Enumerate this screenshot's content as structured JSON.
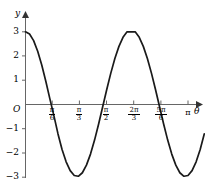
{
  "figure": {
    "background": "#ffffff",
    "curve_color": "#1a1a1a",
    "axis_color": "#555555"
  },
  "axes": {
    "x_axis_name": "θ",
    "y_axis_name": "y",
    "origin_label": "O"
  },
  "chart_data": {
    "type": "line",
    "title": "",
    "xlabel": "θ",
    "ylabel": "y",
    "grid": false,
    "legend": null,
    "function": "y = 3 cos(2θ)",
    "amplitude": 3,
    "period": "π",
    "xlim": [
      0,
      3.4557519
    ],
    "ylim": [
      -3.6,
      3.6
    ],
    "x_ticks": [
      {
        "value": 0.5235988,
        "label_num": "π",
        "label_den": "6"
      },
      {
        "value": 1.0471976,
        "label_num": "π",
        "label_den": "3"
      },
      {
        "value": 1.5707963,
        "label_num": "π",
        "label_den": "2"
      },
      {
        "value": 2.0943951,
        "label_num": "2π",
        "label_den": "3"
      },
      {
        "value": 2.6179939,
        "label_num": "5π",
        "label_den": "6"
      },
      {
        "value": 3.1415927,
        "label_num": "π",
        "label_den": ""
      }
    ],
    "y_ticks": [
      {
        "value": 3,
        "label": "3"
      },
      {
        "value": 2,
        "label": "2"
      },
      {
        "value": 1,
        "label": "1"
      },
      {
        "value": -1,
        "label": "−1"
      },
      {
        "value": -2,
        "label": "−2"
      },
      {
        "value": -3,
        "label": "−3"
      }
    ],
    "key_points": [
      {
        "x": 0,
        "y": 3,
        "note": "maximum at theta = 0"
      },
      {
        "x": 0.7853982,
        "y": 0,
        "note": "zero at pi/4"
      },
      {
        "x": 1.5707963,
        "y": -3,
        "note": "minimum at pi/2"
      },
      {
        "x": 2.3561945,
        "y": 0,
        "note": "zero at 3pi/4"
      },
      {
        "x": 3.1415927,
        "y": 3,
        "note": "maximum at pi"
      }
    ],
    "x": [
      0,
      0.0785398,
      0.1570796,
      0.2356194,
      0.3141593,
      0.3926991,
      0.4712389,
      0.5497787,
      0.6283185,
      0.7068583,
      0.7853982,
      0.863938,
      0.9424778,
      1.0210176,
      1.0995574,
      1.1780972,
      1.256637,
      1.3351769,
      1.4137167,
      1.4922565,
      1.5707963,
      1.6493361,
      1.7278759,
      1.8064158,
      1.8849556,
      1.9634954,
      2.0420352,
      2.120575,
      2.1991149,
      2.2776547,
      2.3561945,
      2.4347343,
      2.5132741,
      2.5918139,
      2.6703538,
      2.7488936,
      2.8274334,
      2.9059732,
      2.984513,
      3.0630528,
      3.1415927,
      3.2201325,
      3.2986723,
      3.3772121,
      3.4557519
    ],
    "y": [
      3,
      2.9079,
      2.6353,
      2.1985,
      1.6271,
      0.9619,
      0.232,
      -0.4683,
      -1.2135,
      -1.8541,
      -2.3647,
      -2.7283,
      -2.9309,
      -2.9617,
      -2.8168,
      -2.5032,
      -2.0467,
      -1.4689,
      -0.8033,
      -0.0941,
      0.618,
      1.2944,
      1.8985,
      2.3985,
      2.7716,
      2.9978,
      3.0,
      2.9978,
      2.7716,
      2.3985,
      1.8985,
      1.2944,
      0.618,
      -0.0941,
      -0.8033,
      -1.4689,
      -2.0467,
      -2.5032,
      -2.8168,
      -2.9617,
      -2.9309,
      -2.7283,
      -2.3647,
      -1.8541,
      -1.2135
    ]
  }
}
